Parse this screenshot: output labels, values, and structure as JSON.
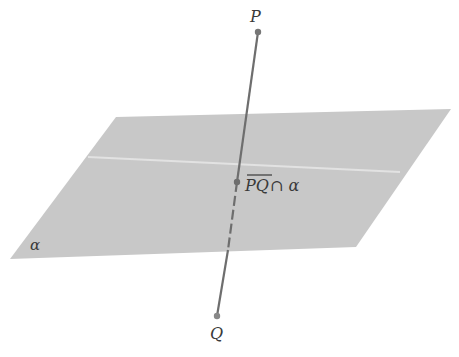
{
  "diagram": {
    "plane": {
      "label": "α",
      "fill": "#c8c8c8",
      "corners": [
        [
          116,
          117
        ],
        [
          451,
          109
        ],
        [
          356,
          247
        ],
        [
          10,
          259
        ]
      ],
      "highlight_line": [
        [
          88,
          157
        ],
        [
          400,
          172
        ]
      ]
    },
    "line": {
      "color": "#6e6e6e",
      "P": {
        "label": "P",
        "x": 258,
        "y": 32
      },
      "Q": {
        "label": "Q",
        "x": 217,
        "y": 316
      },
      "intersection": {
        "x": 237,
        "y": 182,
        "label_over": "PQ",
        "label_rest": " ∩ α"
      }
    }
  }
}
